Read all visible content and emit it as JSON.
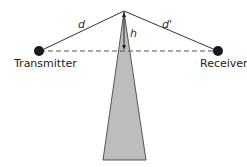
{
  "diagram": {
    "labels": {
      "transmitter": "Transmitter",
      "receiver": "Receiver",
      "d": "d",
      "d_prime": "d'",
      "h": "h"
    },
    "colors": {
      "wedge": "#bdbdbd",
      "line": "#333333",
      "dot": "#1a1a1a"
    }
  }
}
